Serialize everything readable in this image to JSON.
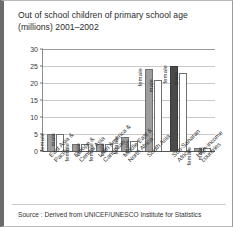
{
  "figure": {
    "title_line1": "Out of school children of primary school age",
    "title_line2": "(millions) 2001–2002",
    "source": "Source : Derived from UNICEF/UNESCO Institute for Statistics"
  },
  "colors": {
    "female_fill": "#9d9d9d",
    "female_highlight_fill": "#4a4a4a",
    "male_fill": "#ffffff",
    "bar_stroke": "#707070",
    "gridline": "#c9c9c9",
    "axis": "#555555",
    "text": "#2b2b2b",
    "left_gutter": "#6b6b6b"
  },
  "series_labels": {
    "female": "female",
    "male": "male"
  },
  "chart_data": {
    "type": "bar",
    "title": "Out of school children of primary school age (millions) 2001–2002",
    "xlabel": "",
    "ylabel": "",
    "ylim": [
      0,
      30
    ],
    "yticks": [
      0,
      5,
      10,
      15,
      20,
      25,
      30
    ],
    "ytick_labels": [
      "0",
      "5",
      "10",
      "15",
      "20",
      "25",
      "30"
    ],
    "grid": true,
    "legend": "none",
    "annotations": [
      "Each bar is directly annotated with its series name: female / male"
    ],
    "categories": [
      "East Asia & Pacific",
      "Europe & Central Asia",
      "Latin America & Caribbean",
      "Middle East & North Africa",
      "South Asia",
      "Sub-Saharan Africa",
      "High-income countries"
    ],
    "category_lines": [
      [
        "East Asia &",
        "Pacific"
      ],
      [
        "Europe &",
        "Central Asia"
      ],
      [
        "Latin America &",
        "Caribbean"
      ],
      [
        "Middle East &",
        "North Africa"
      ],
      [
        "South Asia"
      ],
      [
        "Sub-Saharan",
        "Africa"
      ],
      [
        "High-income",
        "countries"
      ]
    ],
    "series": [
      {
        "name": "female",
        "values": [
          5,
          2,
          2,
          4,
          24,
          25,
          1
        ]
      },
      {
        "name": "male",
        "values": [
          5,
          2,
          2,
          3,
          21,
          23,
          1
        ]
      }
    ],
    "highlighted_bar": {
      "category": "Sub-Saharan Africa",
      "series": "female"
    }
  }
}
